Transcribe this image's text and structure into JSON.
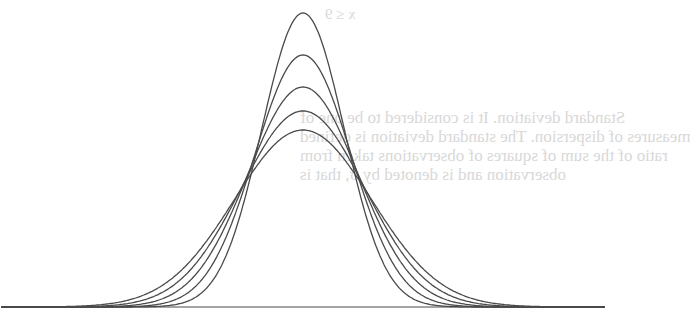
{
  "figure": {
    "baseline": {
      "x1": 22,
      "x2": 598,
      "y": 307
    },
    "center_x": 303,
    "unit_px": 68.6,
    "line_color": "#4a4a4a",
    "bleed_color": "#d8d8d8"
  },
  "chart_data": {
    "type": "line",
    "title": "",
    "xlabel": "",
    "ylabel": "",
    "grid": false,
    "legend": "none",
    "series": [
      {
        "name": "sigma 0.6",
        "sigma": 0.6,
        "peak_height_px": 294
      },
      {
        "name": "sigma 0.7",
        "sigma": 0.7,
        "peak_height_px": 252
      },
      {
        "name": "sigma 0.8",
        "sigma": 0.8,
        "peak_height_px": 220
      },
      {
        "name": "sigma 0.9",
        "sigma": 0.9,
        "peak_height_px": 196
      },
      {
        "name": "sigma 1.0",
        "sigma": 1.0,
        "peak_height_px": 177
      }
    ],
    "xlim": [
      -4.4,
      4.4
    ]
  },
  "bleed_through": {
    "top": "x ≤ 9",
    "lines": [
      "Standard deviation. It is considered to be one of",
      "measures of dispersion. The standard deviation is defined",
      "ratio of the sum of squares of observations taken from",
      "observation and is denoted by σ, that is"
    ]
  }
}
